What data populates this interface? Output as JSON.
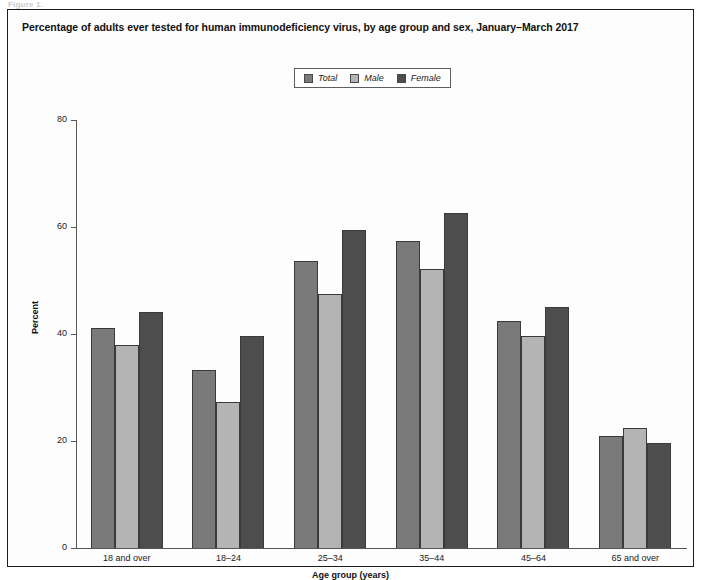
{
  "scan_artifact_text": "Figure 1.",
  "figure": {
    "title": "Percentage of adults ever tested for human immunodeficiency virus, by age group and sex, January–March 2017"
  },
  "legend": {
    "position": "top-center",
    "items": [
      {
        "label": "Total",
        "color": "#7a7a7a"
      },
      {
        "label": "Male",
        "color": "#b4b4b4"
      },
      {
        "label": "Female",
        "color": "#4d4d4d"
      }
    ]
  },
  "chart_data": {
    "type": "bar",
    "title": "Percentage of adults ever tested for human immunodeficiency virus, by age group and sex, January–March 2017",
    "xlabel": "Age group (years)",
    "ylabel": "Percent",
    "ylim": [
      0,
      80
    ],
    "yticks": [
      0,
      20,
      40,
      60,
      80
    ],
    "grid": false,
    "legend_position": "top-center",
    "categories": [
      "18 and over",
      "18–24",
      "25–34",
      "35–44",
      "45–64",
      "65 and over"
    ],
    "series": [
      {
        "name": "Total",
        "color": "#7a7a7a",
        "values": [
          41.1,
          33.3,
          53.6,
          57.4,
          42.5,
          21.0
        ]
      },
      {
        "name": "Male",
        "color": "#b4b4b4",
        "values": [
          37.9,
          27.2,
          47.5,
          52.2,
          39.6,
          22.5
        ]
      },
      {
        "name": "Female",
        "color": "#4d4d4d",
        "values": [
          44.1,
          39.7,
          59.4,
          62.7,
          45.1,
          19.7
        ]
      }
    ]
  }
}
